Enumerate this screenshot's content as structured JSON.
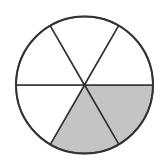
{
  "diagram": {
    "type": "fraction-circle",
    "total_sectors": 6,
    "shaded_sectors": 2,
    "fraction_shaded": "2/6",
    "center": [
      84.5,
      85
    ],
    "radius": 68.5,
    "colors": {
      "background": "#ffffff",
      "stroke": "#333333",
      "shaded_fill": "#c4c4c4",
      "unshaded_fill": "#ffffff"
    },
    "sectors": [
      {
        "index": 0,
        "start_deg": 0,
        "end_deg": 60,
        "shaded": true
      },
      {
        "index": 1,
        "start_deg": 60,
        "end_deg": 120,
        "shaded": true
      },
      {
        "index": 2,
        "start_deg": 120,
        "end_deg": 180,
        "shaded": false
      },
      {
        "index": 3,
        "start_deg": 180,
        "end_deg": 240,
        "shaded": false
      },
      {
        "index": 4,
        "start_deg": 240,
        "end_deg": 300,
        "shaded": false
      },
      {
        "index": 5,
        "start_deg": 300,
        "end_deg": 360,
        "shaded": false
      }
    ]
  }
}
